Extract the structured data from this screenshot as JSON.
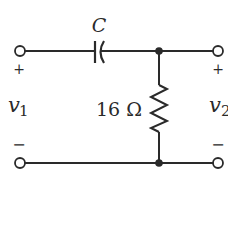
{
  "circuit": {
    "capacitor_label": "C",
    "resistor_label": "16 Ω",
    "input": {
      "name": "v",
      "sub": "1",
      "plus": "+",
      "minus": "−"
    },
    "output": {
      "name": "v",
      "sub": "2",
      "plus": "+",
      "minus": "−"
    },
    "caption": ""
  },
  "colors": {
    "wire": "#2a2a2a",
    "background": "#ffffff"
  }
}
